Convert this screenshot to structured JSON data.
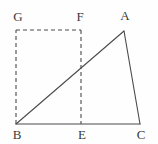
{
  "figure": {
    "type": "geometry-diagram",
    "background_color": "#fefefe",
    "stroke_color": "#4a4a4a",
    "label_color": "#3a3a3a",
    "stroke_width": 1,
    "dash_pattern": "4 3",
    "width": 158,
    "height": 144
  },
  "points": {
    "A": {
      "label": "A",
      "x": 124,
      "y": 31,
      "label_x": 125,
      "label_y": 9
    },
    "B": {
      "label": "B",
      "x": 16,
      "y": 124,
      "label_x": 17,
      "label_y": 128
    },
    "C": {
      "label": "C",
      "x": 140,
      "y": 124,
      "label_x": 141,
      "label_y": 128
    },
    "E": {
      "label": "E",
      "x": 81,
      "y": 124,
      "label_x": 82,
      "label_y": 128
    },
    "F": {
      "label": "F",
      "x": 81,
      "y": 30,
      "label_x": 80,
      "label_y": 10
    },
    "G": {
      "label": "G",
      "x": 16,
      "y": 30,
      "label_x": 18,
      "label_y": 10
    }
  },
  "segments": [
    {
      "name": "segment-BA",
      "from": "B",
      "to": "A",
      "style": "solid"
    },
    {
      "name": "segment-AC",
      "from": "A",
      "to": "C",
      "style": "solid"
    },
    {
      "name": "segment-BC",
      "from": "B",
      "to": "C",
      "style": "solid"
    },
    {
      "name": "segment-BG",
      "from": "B",
      "to": "G",
      "style": "dashed"
    },
    {
      "name": "segment-GF",
      "from": "G",
      "to": "F",
      "style": "dashed"
    },
    {
      "name": "segment-FE",
      "from": "F",
      "to": "E",
      "style": "dashed"
    }
  ]
}
